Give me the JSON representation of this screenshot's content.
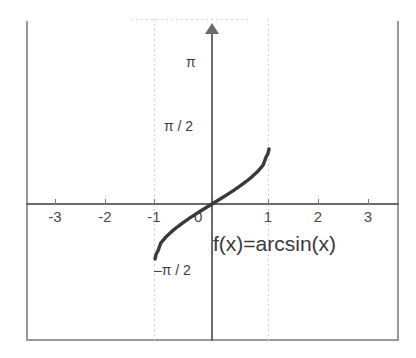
{
  "chart_data": {
    "type": "line",
    "title": "",
    "function_label": "f(x)=arcsin(x)",
    "xlabel": "",
    "ylabel": "",
    "xlim": [
      -3.72,
      3.72
    ],
    "ylim": [
      -3.52,
      3.72
    ],
    "grid": "dotted vertical gridlines at x = -1 and x = 1",
    "legend_position": "inline annotation at lower right of curve",
    "x_ticks": [
      -3,
      -2,
      -1,
      0,
      1,
      2,
      3
    ],
    "x_tick_labels": [
      "-3",
      "-2",
      "-1",
      "0",
      "1",
      "2",
      "3"
    ],
    "y_ticks": [
      1.5708,
      3.1416,
      -1.5708
    ],
    "y_tick_labels": [
      "π / 2",
      "π",
      "–π / 2"
    ],
    "gridlines_x": [
      -1,
      1
    ],
    "series": [
      {
        "name": "f(x)=arcsin(x)",
        "color": "#3a3a3a",
        "domain": [
          -1,
          1
        ],
        "range": [
          -1.5708,
          1.5708
        ],
        "x": [
          -1.0,
          -0.98,
          -0.95,
          -0.9,
          -0.8,
          -0.7,
          -0.6,
          -0.5,
          -0.4,
          -0.3,
          -0.2,
          -0.1,
          0.0,
          0.1,
          0.2,
          0.3,
          0.4,
          0.5,
          0.6,
          0.7,
          0.8,
          0.9,
          0.95,
          0.98,
          1.0
        ],
        "values": [
          -1.5708,
          -1.4293,
          -1.3453,
          -1.1198,
          -0.9273,
          -0.7754,
          -0.6435,
          -0.5236,
          -0.4115,
          -0.3047,
          -0.2014,
          -0.1002,
          0.0,
          0.1002,
          0.2014,
          0.3047,
          0.4115,
          0.5236,
          0.6435,
          0.7754,
          0.9273,
          1.1198,
          1.3453,
          1.4293,
          1.5708
        ]
      }
    ]
  },
  "axes": {
    "x_axis_name": "x-axis",
    "y_axis_name": "y-axis",
    "origin_label": "0"
  },
  "colors": {
    "background": "#ffffff",
    "curve": "#3a3a3a",
    "axis": "#6a6a6a",
    "frame": "#9a9a9a",
    "gridline": "#cfcfcf",
    "tick_text": "#4a4a4a"
  }
}
